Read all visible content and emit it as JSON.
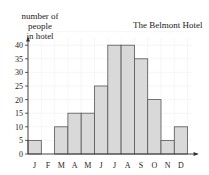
{
  "chart_data": {
    "type": "bar",
    "title": "The Belmont Hotel",
    "xlabel": "",
    "ylabel": "number of people in hotel",
    "ylabel_lines": [
      "number of people",
      "in hotel"
    ],
    "categories": [
      "J",
      "F",
      "M",
      "A",
      "M",
      "J",
      "J",
      "A",
      "S",
      "O",
      "N",
      "D"
    ],
    "values": [
      5,
      0,
      10,
      15,
      15,
      25,
      40,
      40,
      35,
      20,
      5,
      10
    ],
    "yticks": [
      0,
      5,
      10,
      15,
      20,
      25,
      30,
      35,
      40
    ],
    "ylim": [
      0,
      45
    ],
    "grid": true,
    "bar_color": "#d9d9d9",
    "bar_edge_color": "#555555"
  }
}
